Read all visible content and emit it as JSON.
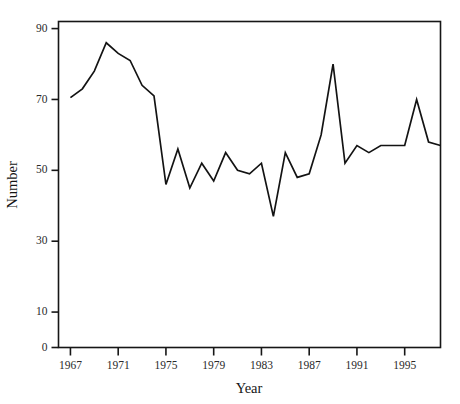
{
  "chart_data": {
    "type": "line",
    "title": "",
    "xlabel": "Year",
    "ylabel": "Number",
    "xlim": [
      1966,
      1998
    ],
    "ylim": [
      0,
      92
    ],
    "grid": false,
    "legend": null,
    "xticks": [
      1967,
      1971,
      1975,
      1979,
      1983,
      1987,
      1991,
      1995
    ],
    "xtick_labels": [
      "1967",
      "1971",
      "1975",
      "1979",
      "1983",
      "1987",
      "1991",
      "1995"
    ],
    "yticks": [
      0,
      10,
      30,
      50,
      70,
      90
    ],
    "ytick_labels": [
      "0",
      "10",
      "30",
      "50",
      "70",
      "90"
    ],
    "x": [
      1967,
      1968,
      1969,
      1970,
      1971,
      1972,
      1973,
      1974,
      1975,
      1976,
      1977,
      1978,
      1979,
      1980,
      1981,
      1982,
      1983,
      1984,
      1985,
      1986,
      1987,
      1988,
      1989,
      1990,
      1991,
      1992,
      1993,
      1994,
      1995,
      1996,
      1997,
      1998
    ],
    "values": [
      70.5,
      73,
      78,
      86,
      83,
      81,
      74,
      71,
      46,
      56,
      45,
      52,
      47,
      55,
      50,
      49,
      52,
      37,
      55,
      48,
      49,
      60,
      80,
      52,
      57,
      55,
      57,
      57,
      57,
      70,
      58,
      57
    ],
    "series": [
      {
        "name": "Number",
        "color": "#131313",
        "values": [
          70.5,
          73,
          78,
          86,
          83,
          81,
          74,
          71,
          46,
          56,
          45,
          52,
          47,
          55,
          50,
          49,
          52,
          37,
          55,
          48,
          49,
          60,
          80,
          52,
          57,
          55,
          57,
          57,
          57,
          70,
          58,
          57
        ]
      }
    ],
    "annotations": []
  },
  "figure": {
    "top_partial_mark": "",
    "background_color": "#ffffff",
    "line_color": "#131313",
    "axis_color": "#161616"
  }
}
